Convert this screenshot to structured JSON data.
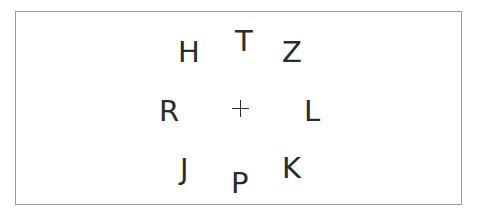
{
  "scene": {
    "type": "letter-acuity-chart",
    "background_color": "#ffffff",
    "frame": {
      "border_color": "#9b9b9b",
      "border_width_px": 1,
      "x": 15,
      "y": 11,
      "width": 447,
      "height": 194
    },
    "text_color": "#2b2b2b"
  },
  "fixation": {
    "symbol": "+",
    "name": "plus-fixation-cross",
    "x": 240,
    "y": 108
  },
  "rows": [
    {
      "name": "top-row",
      "letters": [
        {
          "char": "H",
          "x": 178,
          "y": 38,
          "size": 29
        },
        {
          "char": "T",
          "x": 235,
          "y": 27,
          "size": 29
        },
        {
          "char": "Z",
          "x": 282,
          "y": 38,
          "size": 29
        }
      ]
    },
    {
      "name": "middle-row",
      "letters": [
        {
          "char": "R",
          "x": 159,
          "y": 97,
          "size": 29
        },
        {
          "char": "L",
          "x": 304,
          "y": 97,
          "size": 29
        }
      ]
    },
    {
      "name": "bottom-row",
      "letters": [
        {
          "char": "J",
          "x": 180,
          "y": 155,
          "size": 29
        },
        {
          "char": "P",
          "x": 231,
          "y": 169,
          "size": 29
        },
        {
          "char": "K",
          "x": 282,
          "y": 154,
          "size": 29
        }
      ]
    }
  ],
  "letters_flat": [
    "H",
    "T",
    "Z",
    "R",
    "+",
    "L",
    "J",
    "P",
    "K"
  ]
}
